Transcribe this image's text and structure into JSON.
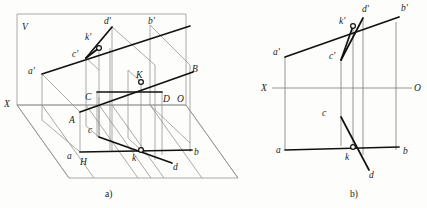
{
  "figure": {
    "captions": {
      "a": "a)",
      "b": "b)"
    }
  },
  "panel_a": {
    "name": "pictorial-projection-view",
    "plane_labels": {
      "v_plane": "V",
      "h_plane": "H",
      "x_axis": "X",
      "origin": "O"
    },
    "points": [
      {
        "id": "a-prime",
        "label": "a'",
        "x": 33,
        "y": 72
      },
      {
        "id": "b-prime",
        "label": "b'",
        "x": 152,
        "y": 22
      },
      {
        "id": "c-prime",
        "label": "c'",
        "x": 76,
        "y": 55
      },
      {
        "id": "d-prime",
        "label": "d'",
        "x": 108,
        "y": 22
      },
      {
        "id": "k-prime",
        "label": "k'",
        "x": 92,
        "y": 38
      },
      {
        "id": "A",
        "label": "A",
        "x": 73,
        "y": 120
      },
      {
        "id": "B",
        "label": "B",
        "x": 196,
        "y": 70
      },
      {
        "id": "C",
        "label": "C",
        "x": 88,
        "y": 97
      },
      {
        "id": "D",
        "label": "D",
        "x": 166,
        "y": 99
      },
      {
        "id": "K",
        "label": "K",
        "x": 140,
        "y": 80
      },
      {
        "id": "a",
        "label": "a",
        "x": 70,
        "y": 156
      },
      {
        "id": "b",
        "label": "b",
        "x": 196,
        "y": 153
      },
      {
        "id": "c",
        "label": "c",
        "x": 90,
        "y": 130
      },
      {
        "id": "d",
        "label": "d",
        "x": 175,
        "y": 167
      },
      {
        "id": "k",
        "label": "k",
        "x": 135,
        "y": 158
      }
    ],
    "lines": [
      {
        "id": "line-ab-prime",
        "from": "a'",
        "to": "b'",
        "style": "bold"
      },
      {
        "id": "line-cd-prime",
        "from": "c'",
        "to": "d'",
        "style": "bold"
      },
      {
        "id": "line-AB",
        "from": "A",
        "to": "B",
        "style": "bold"
      },
      {
        "id": "line-CD",
        "from": "C",
        "to": "D",
        "style": "bold"
      },
      {
        "id": "line-ab",
        "from": "a",
        "to": "b",
        "style": "bold"
      },
      {
        "id": "line-cd",
        "from": "c",
        "to": "d",
        "style": "bold"
      }
    ],
    "intersections": [
      {
        "id": "k-prime-marker",
        "label": "k'"
      },
      {
        "id": "K-marker",
        "label": "K"
      },
      {
        "id": "k-marker",
        "label": "k"
      }
    ]
  },
  "panel_b": {
    "name": "orthographic-projection-view",
    "axis_labels": {
      "x_axis": "X",
      "origin": "O"
    },
    "points": [
      {
        "id": "a-prime-b",
        "label": "a'",
        "x": 277,
        "y": 53
      },
      {
        "id": "b-prime-b",
        "label": "b'",
        "x": 404,
        "y": 9
      },
      {
        "id": "c-prime-b",
        "label": "c'",
        "x": 332,
        "y": 57
      },
      {
        "id": "d-prime-b",
        "label": "d'",
        "x": 365,
        "y": 10
      },
      {
        "id": "k-prime-b",
        "label": "k'",
        "x": 342,
        "y": 22
      },
      {
        "id": "a-b",
        "label": "a",
        "x": 290,
        "y": 153
      },
      {
        "id": "b-b",
        "label": "b",
        "x": 406,
        "y": 152
      },
      {
        "id": "c-b",
        "label": "c",
        "x": 324,
        "y": 113
      },
      {
        "id": "d-b",
        "label": "d",
        "x": 372,
        "y": 175
      },
      {
        "id": "k-b",
        "label": "k",
        "x": 347,
        "y": 161
      }
    ],
    "lines": [
      {
        "id": "line-ab-prime-b",
        "from": "a'",
        "to": "b'",
        "style": "bold"
      },
      {
        "id": "line-cd-prime-b",
        "from": "c'",
        "to": "d'",
        "style": "bold"
      },
      {
        "id": "line-ab-b",
        "from": "a",
        "to": "b",
        "style": "bold"
      },
      {
        "id": "line-cd-b",
        "from": "c",
        "to": "d",
        "style": "bold"
      }
    ],
    "projection_lines": [
      {
        "id": "proj-a",
        "x": 285
      },
      {
        "id": "proj-c",
        "x": 341
      },
      {
        "id": "proj-k",
        "x": 353
      },
      {
        "id": "proj-d",
        "x": 363
      },
      {
        "id": "proj-b",
        "x": 396
      }
    ]
  }
}
